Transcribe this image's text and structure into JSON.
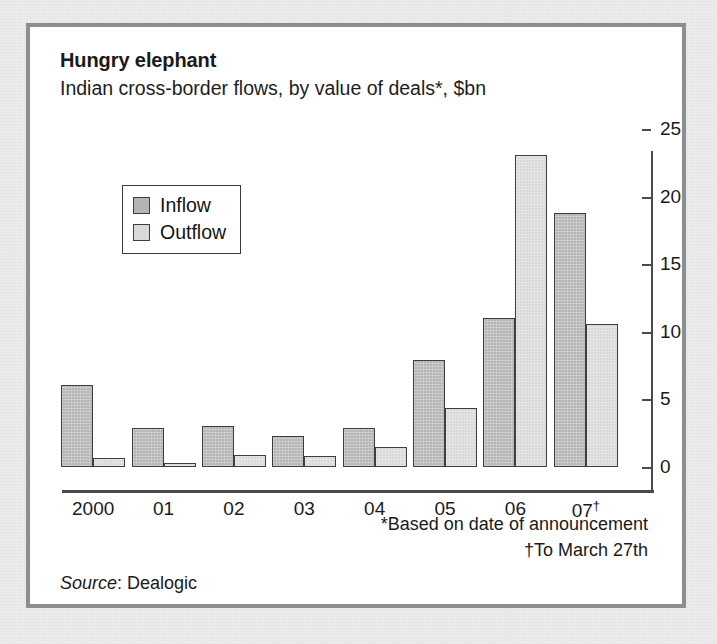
{
  "chart_data": {
    "type": "bar",
    "title": "Hungry elephant",
    "subtitle": "Indian cross-border flows, by value of deals*, $bn",
    "xlabel": "",
    "ylabel": "",
    "ylim": [
      0,
      25
    ],
    "yticks": [
      0,
      5,
      10,
      15,
      20,
      25
    ],
    "ytick_labels": [
      "0",
      "5",
      "10",
      "15",
      "20",
      "25"
    ],
    "grid": false,
    "y_axis_position": "right",
    "legend_position": "upper-left inside plot",
    "categories": [
      "2000",
      "01",
      "02",
      "03",
      "04",
      "05",
      "06",
      "07†"
    ],
    "series": [
      {
        "name": "Inflow",
        "color": "#b4b4b4",
        "values": [
          6.1,
          2.9,
          3.0,
          2.3,
          2.9,
          7.9,
          11.0,
          18.8
        ]
      },
      {
        "name": "Outflow",
        "color": "#d9d9d9",
        "values": [
          0.7,
          0.3,
          0.9,
          0.8,
          1.5,
          4.4,
          23.1,
          10.6
        ]
      }
    ],
    "annotations": [
      "*Based on date of announcement",
      "†To March 27th"
    ],
    "source_prefix": "Source",
    "source_separator": ": ",
    "source_value": "Dealogic"
  },
  "legend": {
    "items": [
      {
        "label": "Inflow",
        "swatch": "inflow-swatch"
      },
      {
        "label": "Outflow",
        "swatch": "outflow-swatch"
      }
    ]
  },
  "footnotes": {
    "line1": "*Based on date of announcement",
    "line2": "†To March 27th"
  },
  "source": {
    "prefix": "Source",
    "separator": ": ",
    "value": "Dealogic"
  },
  "colors": {
    "inflow": "#b4b4b4",
    "outflow": "#d9d9d9",
    "axis": "#4a4a4a",
    "frame": "#8c8e90",
    "page_background": "#ececed",
    "panel_background": "#ffffff",
    "text": "#1a1a1a"
  }
}
